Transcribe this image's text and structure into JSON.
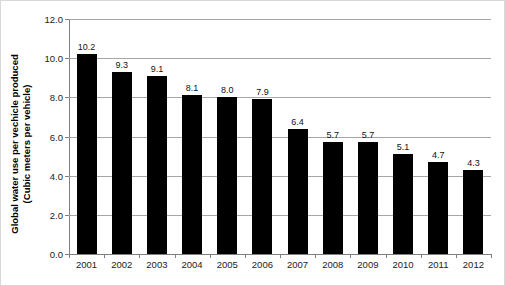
{
  "chart_data": {
    "type": "bar",
    "title": "",
    "subtitle": "",
    "xlabel": "",
    "ylabel": "Global water use per vechicle produced (Cubic meters per vehicle)",
    "ylabel_lines": [
      "Global water use per vechicle produced",
      "(Cubic meters per vehicle)"
    ],
    "categories": [
      "2001",
      "2002",
      "2003",
      "2004",
      "2005",
      "2006",
      "2007",
      "2008",
      "2009",
      "2010",
      "2011",
      "2012"
    ],
    "values": [
      10.2,
      9.3,
      9.1,
      8.1,
      8.0,
      7.9,
      6.4,
      5.7,
      5.7,
      5.1,
      4.7,
      4.3
    ],
    "data_labels": [
      "10.2",
      "9.3",
      "9.1",
      "8.1",
      "8.0",
      "7.9",
      "6.4",
      "5.7",
      "5.7",
      "5.1",
      "4.7",
      "4.3"
    ],
    "ylim": [
      0.0,
      12.0
    ],
    "ytick_values": [
      0.0,
      2.0,
      4.0,
      6.0,
      8.0,
      10.0,
      12.0
    ],
    "ytick_labels": [
      "0.0",
      "2.0",
      "4.0",
      "6.0",
      "8.0",
      "10.0",
      "12.0"
    ],
    "grid": true,
    "grid_axis": "y",
    "legend": false,
    "legend_position": "none",
    "bar_color": "#000000",
    "gridline_color": "#A6A6A6",
    "axis_color": "#808080",
    "background_color": "#FFFFFF",
    "text_color": "#222222"
  }
}
